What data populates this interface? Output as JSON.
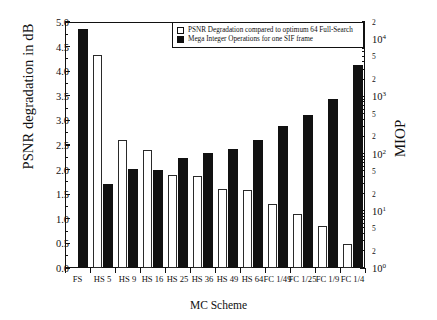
{
  "chart_data": {
    "type": "bar",
    "title": "",
    "xlabel": "MC Scheme",
    "ylabel": "PSNR degradation in dB",
    "ylabel_right": "MIOP",
    "categories": [
      "FS",
      "HS 5",
      "HS 9",
      "HS 16",
      "HS 25",
      "HS 36",
      "HS 49",
      "HS 64",
      "FC 1/49",
      "FC 1/25",
      "FC 1/9",
      "FC 1/4"
    ],
    "ylim": [
      0.0,
      5.0
    ],
    "yticks": [
      "0.0",
      "0.5",
      "1.0",
      "1.5",
      "2.0",
      "2.5",
      "3.0",
      "3.5",
      "4.0",
      "4.5",
      "5.0"
    ],
    "right_axis_scale": "log",
    "right_ylim": [
      1,
      20000
    ],
    "right_ticks": [
      "10⁰",
      "2",
      "5",
      "10¹",
      "2",
      "5",
      "10²",
      "2",
      "5",
      "10³",
      "2",
      "5",
      "10⁴",
      "2"
    ],
    "grid": false,
    "legend_position": "top-right",
    "series": [
      {
        "name": "PSNR Degradation compared to optimum 64 Full-Search",
        "style": "white",
        "values": [
          0.0,
          4.33,
          2.6,
          2.39,
          1.89,
          1.88,
          1.6,
          1.58,
          1.31,
          1.09,
          0.85,
          0.49
        ]
      },
      {
        "name": "Mega Integer Operations for one SIF frame",
        "style": "black",
        "values": [
          4.85,
          1.71,
          2.01,
          1.99,
          2.23,
          2.33,
          2.42,
          2.61,
          2.88,
          3.1,
          3.43,
          4.12
        ]
      }
    ]
  },
  "legend": {
    "entries": [
      {
        "label": "PSNR Degradation compared to optimum 64 Full-Search",
        "swatch": "white"
      },
      {
        "label": "Mega Integer Operations for one SIF frame",
        "swatch": "black"
      }
    ]
  },
  "axes": {
    "left_title": "PSNR degradation in dB",
    "right_title": "MIOP",
    "bottom_title": "MC Scheme"
  }
}
